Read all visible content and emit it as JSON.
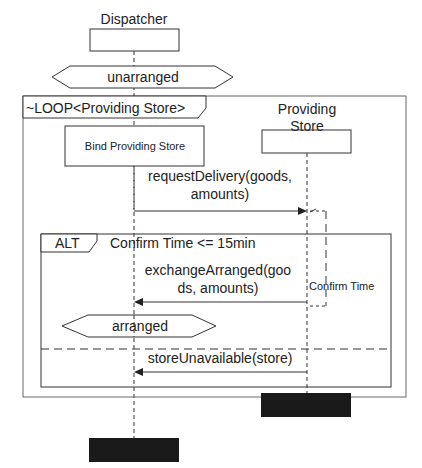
{
  "lifelines": {
    "dispatcher": {
      "label": "Dispatcher"
    },
    "providing_store": {
      "label_line1": "Providing",
      "label_line2": "Store"
    }
  },
  "states": {
    "unarranged": "unarranged",
    "arranged": "arranged"
  },
  "loop_frame": {
    "label": "~LOOP<Providing Store>"
  },
  "bind_action": {
    "label": "Bind Providing Store"
  },
  "messages": {
    "request_delivery": {
      "line1": "requestDelivery(goods,",
      "line2": "amounts)"
    },
    "exchange_arranged": {
      "line1": "exchangeArranged(goo",
      "line2": "ds, amounts)"
    },
    "store_unavailable": {
      "line1": "storeUnavailable(store)"
    }
  },
  "alt_frame": {
    "label": "ALT",
    "guard": "Confirm Time <= 15min"
  },
  "duration_constraint": {
    "label": "Confirm Time"
  },
  "colors": {
    "line": "#333333",
    "terminator": "#1a1a1a",
    "guard_text": "#666666"
  }
}
